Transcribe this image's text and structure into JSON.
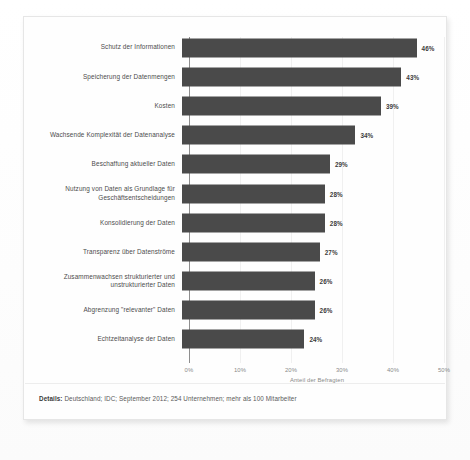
{
  "chart_data": {
    "type": "bar",
    "orientation": "horizontal",
    "title": "",
    "xlabel": "Anteil der Befragten",
    "ylabel": "",
    "xlim": [
      0,
      50
    ],
    "grid": true,
    "legend": "none",
    "tick_labels": [
      "0%",
      "10%",
      "20%",
      "30%",
      "40%",
      "50%"
    ],
    "tick_values": [
      0,
      10,
      20,
      30,
      40,
      50
    ],
    "categories": [
      "Schutz der Informationen",
      "Speicherung der Datenmengen",
      "Kosten",
      "Wachsende Komplexität der Datenanalyse",
      "Beschaffung aktueller Daten",
      "Nutzung von Daten als Grundlage für Geschäftsentscheidungen",
      "Konsolidierung der Daten",
      "Transparenz über Datenströme",
      "Zusammenwachsen strukturierter und unstrukturierter Daten",
      "Abgrenzung \"relevanter\" Daten",
      "Echtzeitanalyse der Daten"
    ],
    "values": [
      46,
      43,
      39,
      34,
      29,
      28,
      28,
      27,
      26,
      26,
      24
    ],
    "value_labels": [
      "46%",
      "43%",
      "39%",
      "34%",
      "29%",
      "28%",
      "28%",
      "27%",
      "26%",
      "26%",
      "24%"
    ],
    "bar_color": "#4a4a4a"
  },
  "rows": [
    {
      "label": "Schutz der Informationen",
      "value": 46,
      "value_label": "46%"
    },
    {
      "label": "Speicherung der Datenmengen",
      "value": 43,
      "value_label": "43%"
    },
    {
      "label": "Kosten",
      "value": 39,
      "value_label": "39%"
    },
    {
      "label": "Wachsende Komplexität der Datenanalyse",
      "value": 34,
      "value_label": "34%"
    },
    {
      "label": "Beschaffung aktueller Daten",
      "value": 29,
      "value_label": "29%"
    },
    {
      "label": "Nutzung von Daten als Grundlage für Geschäftsentscheidungen",
      "value": 28,
      "value_label": "28%"
    },
    {
      "label": "Konsolidierung der Daten",
      "value": 28,
      "value_label": "28%"
    },
    {
      "label": "Transparenz über Datenströme",
      "value": 27,
      "value_label": "27%"
    },
    {
      "label": "Zusammenwachsen strukturierter und unstrukturierter Daten",
      "value": 26,
      "value_label": "26%"
    },
    {
      "label": "Abgrenzung \"relevanter\" Daten",
      "value": 26,
      "value_label": "26%"
    },
    {
      "label": "Echtzeitanalyse der Daten",
      "value": 24,
      "value_label": "24%"
    }
  ],
  "axis": {
    "ticks": [
      "0%",
      "10%",
      "20%",
      "30%",
      "40%",
      "50%"
    ],
    "title": "Anteil der Befragten"
  },
  "footer": {
    "label": "Details:",
    "text": " Deutschland; IDC; September 2012; 254 Unternehmen; mehr als 100 Mitarbeiter"
  },
  "colors": {
    "bar": "#4a4a4a",
    "axis": "#8a8a8a",
    "card_border": "#e6e6e6"
  }
}
